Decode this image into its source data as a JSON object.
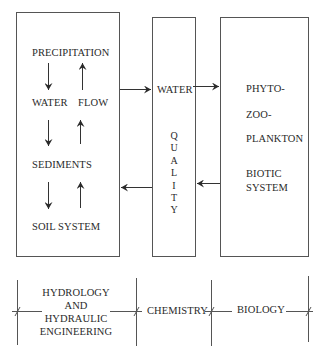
{
  "diagram": {
    "boxes": {
      "soil": {
        "precipitation": "PRECIPITATION",
        "water": "WATER",
        "flow": "FLOW",
        "sediments": "SEDIMENTS",
        "soil_system": "SOIL  SYSTEM"
      },
      "water_quality": {
        "water": "WATER",
        "quality_vertical": "Q\nU\nA\nL\nI\nT\nY"
      },
      "biotic": {
        "phyto": "PHYTO-",
        "zoo": "ZOO-",
        "plankton": "PLANKTON",
        "biotic": "BIOTIC",
        "system": "SYSTEM"
      }
    },
    "disciplines": {
      "hydrology_line1": "HYDROLOGY",
      "hydrology_line2": "AND",
      "hydrology_line3": "HYDRAULIC",
      "hydrology_line4": "ENGINEERING",
      "chemistry": "CHEMISTRY",
      "biology": "BIOLOGY"
    },
    "colors": {
      "line": "#555555",
      "text": "#2a2a2a"
    }
  }
}
